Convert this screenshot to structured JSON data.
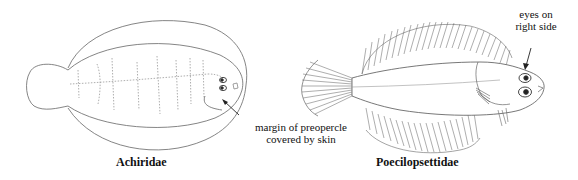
{
  "figures": [
    {
      "caption": "Achiridae",
      "annotation": {
        "line1": "margin of preopercle",
        "line2": "covered by skin"
      }
    },
    {
      "caption": "Poecilopsettidae",
      "annotation": {
        "line1": "eyes on",
        "line2": "right side"
      }
    }
  ],
  "colors": {
    "line": "#555555",
    "text": "#111111",
    "background": "#ffffff"
  }
}
